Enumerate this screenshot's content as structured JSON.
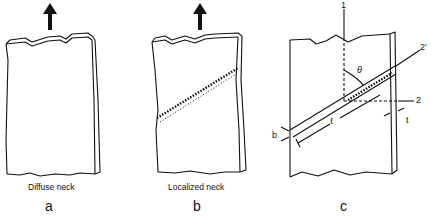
{
  "figure": {
    "panels": [
      {
        "id": "a",
        "caption": "Diffuse neck",
        "letter": "a"
      },
      {
        "id": "b",
        "caption": "Localized neck",
        "letter": "b"
      },
      {
        "id": "c",
        "caption": "",
        "letter": "c"
      }
    ],
    "panel_c_labels": {
      "axis_1": "1",
      "axis_2": "2",
      "axis_2_prime": "2'",
      "angle": "θ",
      "length": "ℓ",
      "width": "b",
      "thickness": "t"
    },
    "colors": {
      "line": "#111111",
      "background": "#ffffff"
    }
  }
}
